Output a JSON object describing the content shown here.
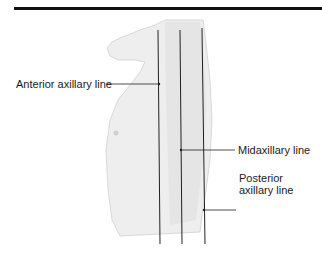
{
  "figure": {
    "labels": {
      "anterior": "Anterior axillary line",
      "midaxillary": "Midaxillary line",
      "posterior_line1": "Posterior",
      "posterior_line2": "axillary line"
    },
    "colors": {
      "line": "#222222",
      "body_fill": "#ececec",
      "body_shade": "#d8d8d8",
      "rule": "#111111"
    }
  }
}
